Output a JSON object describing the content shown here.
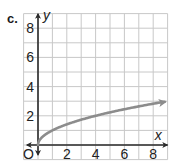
{
  "problem_label": "c.",
  "chart_data": {
    "type": "line",
    "title": "",
    "xlabel": "x",
    "ylabel": "y",
    "origin_label": "O",
    "xlim": [
      -1,
      9
    ],
    "ylim": [
      -1,
      9
    ],
    "grid": true,
    "x_ticks": [
      2,
      4,
      6,
      8
    ],
    "y_ticks": [
      2,
      4,
      6,
      8
    ],
    "x_tick_labels": [
      "2",
      "4",
      "6",
      "8"
    ],
    "y_tick_labels": [
      "2",
      "4",
      "6",
      "8"
    ],
    "series": [
      {
        "name": "y = sqrt(x)",
        "x": [
          0,
          0.25,
          1,
          2,
          3,
          4,
          5,
          6,
          7,
          8,
          8.8
        ],
        "y": [
          0,
          0.5,
          1,
          1.41,
          1.73,
          2,
          2.24,
          2.45,
          2.65,
          2.83,
          2.97
        ],
        "color": "#8c8c8c",
        "endpoint_arrow": "right"
      }
    ]
  },
  "colors": {
    "grid": "#c8c8c8",
    "axis": "#2a2a2a",
    "curve": "#8c8c8c"
  }
}
